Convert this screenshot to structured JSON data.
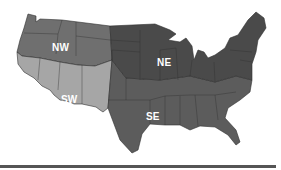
{
  "map": {
    "title": "US regions map",
    "regions": [
      {
        "id": "NW",
        "label": "NW",
        "color": "#6f6f6f"
      },
      {
        "id": "NE",
        "label": "NE",
        "color": "#4a4a4a"
      },
      {
        "id": "SW",
        "label": "SW",
        "color": "#a6a6a6"
      },
      {
        "id": "SE",
        "label": "SE",
        "color": "#5c5c5c"
      }
    ]
  },
  "colors": {
    "background": "#ffffff",
    "border": "#2f2f2f",
    "label": "#ffffff",
    "bottom_bar": "#555555"
  }
}
